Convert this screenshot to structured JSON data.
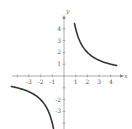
{
  "chart_data": {
    "type": "line",
    "title": "",
    "function": "y = 4/x",
    "xlabel": "x",
    "ylabel": "y",
    "xlim": [
      -4.5,
      4.5
    ],
    "ylim": [
      -4.3,
      4.5
    ],
    "grid": false,
    "legend": null,
    "xtick_labels": [
      "-3",
      "-2",
      "-1",
      "1",
      "2",
      "3",
      "4"
    ],
    "xticks_all": [
      -4,
      -3,
      -2,
      -1,
      1,
      2,
      3,
      4
    ],
    "ytick_labels": [
      "4",
      "3",
      "2",
      "1",
      "-2",
      "-3"
    ],
    "yticks_all": [
      -4,
      -3,
      -2,
      -1,
      1,
      2,
      3,
      4
    ],
    "inferred_ticks": {
      "y": [
        -4
      ],
      "note": "The -4 y-tick label is cut off at the bottom edge; inferred by continuing the axis pattern, not read directly."
    },
    "series": [
      {
        "name": "branch-positive",
        "x": [
          0.9,
          1,
          1.25,
          1.5,
          2,
          2.5,
          3,
          3.5,
          4,
          4.5
        ],
        "y": [
          4.44,
          4,
          3.2,
          2.67,
          2,
          1.6,
          1.33,
          1.14,
          1,
          0.89
        ]
      },
      {
        "name": "branch-negative",
        "x": [
          -4.5,
          -4,
          -3.5,
          -3,
          -2.5,
          -2,
          -1.5,
          -1.25,
          -1,
          -0.9
        ],
        "y": [
          -0.89,
          -1,
          -1.14,
          -1.33,
          -1.6,
          -2,
          -2.67,
          -3.2,
          -4,
          -4.44
        ]
      }
    ]
  },
  "labels": {
    "x_axis": "x",
    "y_axis": "y",
    "x_ticks": [
      "-3",
      "-2",
      "-1",
      "1",
      "2",
      "3",
      "4"
    ],
    "y_ticks_pos": [
      "1",
      "2",
      "3",
      "4"
    ],
    "y_ticks_neg": [
      "-2",
      "-3"
    ]
  },
  "colors": {
    "curve": "#333333",
    "axis": "#888888",
    "label": "#555555"
  }
}
